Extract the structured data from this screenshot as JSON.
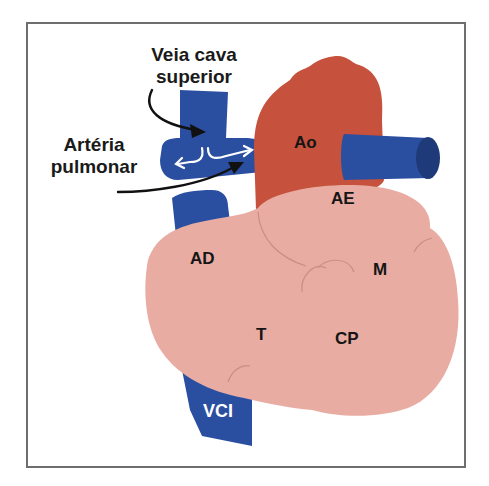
{
  "diagram": {
    "callouts": [
      {
        "id": "svc",
        "line1": "Veia cava",
        "line2": "superior"
      },
      {
        "id": "pa",
        "line1": "Artéria",
        "line2": "pulmonar"
      }
    ],
    "labels": {
      "ao": "Ao",
      "ae": "AE",
      "ad": "AD",
      "m": "M",
      "t": "T",
      "cp": "CP",
      "vci": "VCI"
    },
    "colors": {
      "vein_blue": "#2b4fa0",
      "vein_blue_dark": "#1f3a78",
      "aorta_red": "#c6513c",
      "heart_pink": "#e9aca3",
      "contour": "#c98d85",
      "frame": "#6e6e6e",
      "text": "#151515"
    }
  }
}
